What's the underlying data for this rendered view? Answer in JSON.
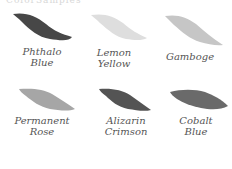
{
  "header": {
    "fragment": "ColorSamples"
  },
  "swatches": [
    {
      "line1": "Phthalo",
      "line2": "Blue",
      "color": "#474747"
    },
    {
      "line1": "Lemon",
      "line2": "Yellow",
      "color": "#dedede"
    },
    {
      "line1": "Gamboge",
      "line2": "",
      "color": "#c6c6c6"
    },
    {
      "line1": "Permanent",
      "line2": "Rose",
      "color": "#a6a6a6"
    },
    {
      "line1": "Alizarin",
      "line2": "Crimson",
      "color": "#545454"
    },
    {
      "line1": "Cobalt",
      "line2": "Blue",
      "color": "#6a6a6a"
    }
  ]
}
